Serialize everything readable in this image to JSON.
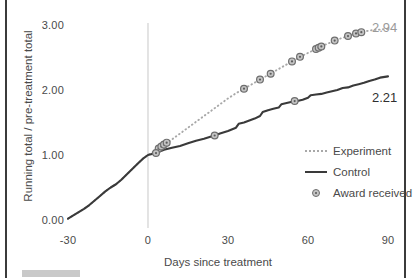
{
  "chart_data": {
    "type": "line",
    "title": "",
    "xlabel": "Days since treatment",
    "ylabel": "Running total / pre-treatment total",
    "xlim": [
      -33,
      95
    ],
    "ylim": [
      -0.1,
      3.15
    ],
    "xticks": [
      -30,
      0,
      30,
      60,
      90
    ],
    "xtick_labels": [
      "-30",
      "0",
      "30",
      "60",
      "90"
    ],
    "yticks": [
      0,
      1,
      2,
      3
    ],
    "ytick_labels": [
      "0.00",
      "1.00",
      "2.00",
      "3.00"
    ],
    "grid": false,
    "legend_position": "right-middle",
    "reference_line": {
      "x": 0,
      "label": "treatment",
      "color": "#d5d5d5"
    },
    "end_labels": [
      {
        "series": "Experiment",
        "value": "2.94",
        "color": "#9a9a9a"
      },
      {
        "series": "Control",
        "value": "2.21",
        "color": "#2f2f2f"
      }
    ],
    "series": [
      {
        "name": "Experiment",
        "style": "dotted",
        "color": "#a8a8a8",
        "points": [
          [
            -30,
            0.02
          ],
          [
            -28,
            0.07
          ],
          [
            -26,
            0.12
          ],
          [
            -24,
            0.17
          ],
          [
            -22,
            0.23
          ],
          [
            -20,
            0.3
          ],
          [
            -18,
            0.37
          ],
          [
            -16,
            0.44
          ],
          [
            -14,
            0.5
          ],
          [
            -12,
            0.55
          ],
          [
            -10,
            0.62
          ],
          [
            -8,
            0.7
          ],
          [
            -6,
            0.78
          ],
          [
            -4,
            0.86
          ],
          [
            -2,
            0.94
          ],
          [
            0,
            1.0
          ],
          [
            2,
            1.05
          ],
          [
            4,
            1.1
          ],
          [
            6,
            1.15
          ],
          [
            8,
            1.21
          ],
          [
            10,
            1.27
          ],
          [
            12,
            1.33
          ],
          [
            14,
            1.39
          ],
          [
            16,
            1.45
          ],
          [
            18,
            1.51
          ],
          [
            20,
            1.57
          ],
          [
            22,
            1.63
          ],
          [
            24,
            1.69
          ],
          [
            26,
            1.75
          ],
          [
            28,
            1.81
          ],
          [
            30,
            1.87
          ],
          [
            33,
            1.95
          ],
          [
            36,
            2.02
          ],
          [
            39,
            2.09
          ],
          [
            42,
            2.16
          ],
          [
            45,
            2.23
          ],
          [
            48,
            2.3
          ],
          [
            51,
            2.37
          ],
          [
            54,
            2.44
          ],
          [
            57,
            2.51
          ],
          [
            60,
            2.57
          ],
          [
            63,
            2.63
          ],
          [
            66,
            2.69
          ],
          [
            69,
            2.74
          ],
          [
            72,
            2.79
          ],
          [
            75,
            2.83
          ],
          [
            78,
            2.87
          ],
          [
            81,
            2.9
          ],
          [
            84,
            2.92
          ],
          [
            87,
            2.93
          ],
          [
            90,
            2.94
          ]
        ]
      },
      {
        "name": "Control",
        "style": "solid",
        "color": "#3a3a3a",
        "points": [
          [
            -30,
            0.02
          ],
          [
            -28,
            0.07
          ],
          [
            -26,
            0.12
          ],
          [
            -24,
            0.17
          ],
          [
            -22,
            0.23
          ],
          [
            -20,
            0.3
          ],
          [
            -18,
            0.37
          ],
          [
            -16,
            0.44
          ],
          [
            -14,
            0.5
          ],
          [
            -12,
            0.55
          ],
          [
            -10,
            0.62
          ],
          [
            -8,
            0.7
          ],
          [
            -6,
            0.78
          ],
          [
            -4,
            0.86
          ],
          [
            -2,
            0.94
          ],
          [
            0,
            1.0
          ],
          [
            3,
            1.03
          ],
          [
            6,
            1.08
          ],
          [
            9,
            1.11
          ],
          [
            12,
            1.14
          ],
          [
            15,
            1.18
          ],
          [
            18,
            1.22
          ],
          [
            21,
            1.25
          ],
          [
            24,
            1.29
          ],
          [
            25,
            1.3
          ],
          [
            27,
            1.33
          ],
          [
            30,
            1.37
          ],
          [
            33,
            1.42
          ],
          [
            34,
            1.48
          ],
          [
            36,
            1.5
          ],
          [
            38,
            1.53
          ],
          [
            40,
            1.56
          ],
          [
            42,
            1.6
          ],
          [
            43,
            1.66
          ],
          [
            45,
            1.69
          ],
          [
            47,
            1.71
          ],
          [
            49,
            1.73
          ],
          [
            50,
            1.78
          ],
          [
            52,
            1.8
          ],
          [
            54,
            1.82
          ],
          [
            56,
            1.83
          ],
          [
            58,
            1.85
          ],
          [
            60,
            1.88
          ],
          [
            61,
            1.92
          ],
          [
            63,
            1.93
          ],
          [
            65,
            1.94
          ],
          [
            67,
            1.96
          ],
          [
            69,
            1.98
          ],
          [
            71,
            2.0
          ],
          [
            73,
            2.03
          ],
          [
            75,
            2.04
          ],
          [
            77,
            2.07
          ],
          [
            79,
            2.09
          ],
          [
            81,
            2.11
          ],
          [
            83,
            2.14
          ],
          [
            85,
            2.16
          ],
          [
            87,
            2.19
          ],
          [
            90,
            2.21
          ]
        ]
      }
    ],
    "markers": {
      "name": "Award received",
      "fill": "#c4c4c4",
      "edge": "#6e6e6e",
      "experiment_points": [
        [
          4,
          1.1
        ],
        [
          5,
          1.13
        ],
        [
          6,
          1.16
        ],
        [
          7,
          1.19
        ],
        [
          36,
          2.02
        ],
        [
          42,
          2.16
        ],
        [
          46,
          2.25
        ],
        [
          54,
          2.44
        ],
        [
          57,
          2.51
        ],
        [
          63,
          2.63
        ],
        [
          64,
          2.65
        ],
        [
          65,
          2.67
        ],
        [
          70,
          2.76
        ],
        [
          75,
          2.83
        ],
        [
          78,
          2.87
        ],
        [
          80,
          2.89
        ]
      ],
      "control_points": [
        [
          3,
          1.03
        ],
        [
          25,
          1.3
        ],
        [
          55,
          1.83
        ]
      ]
    },
    "legend": [
      {
        "label": "Experiment",
        "key": "dotted-line"
      },
      {
        "label": "Control",
        "key": "solid-line"
      },
      {
        "label": "Award received",
        "key": "circle-marker"
      }
    ]
  }
}
